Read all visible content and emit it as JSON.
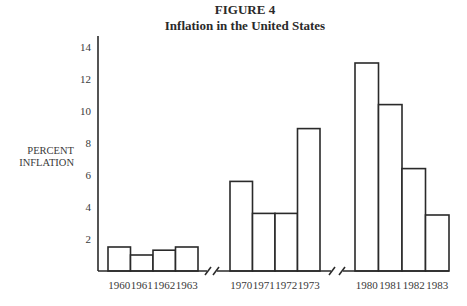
{
  "chart_data": {
    "type": "bar",
    "title": "FIGURE 4",
    "subtitle": "Inflation in the United States",
    "xlabel": "",
    "ylabel_lines": [
      "PERCENT",
      "INFLATION"
    ],
    "ylim": [
      0,
      15
    ],
    "yticks": [
      2,
      4,
      6,
      8,
      10,
      12,
      14
    ],
    "grid": false,
    "legend": "none",
    "axis_breaks": [
      "between 1963 and 1970",
      "between 1973 and 1980"
    ],
    "groups": [
      {
        "categories": [
          "1960",
          "1961",
          "1962",
          "1963"
        ],
        "values": [
          1.5,
          1.0,
          1.3,
          1.5
        ]
      },
      {
        "categories": [
          "1970",
          "1971",
          "1972",
          "1973"
        ],
        "values": [
          5.6,
          3.6,
          3.6,
          8.9
        ]
      },
      {
        "categories": [
          "1980",
          "1981",
          "1982",
          "1983"
        ],
        "values": [
          13.0,
          10.4,
          6.4,
          3.5
        ]
      }
    ]
  }
}
